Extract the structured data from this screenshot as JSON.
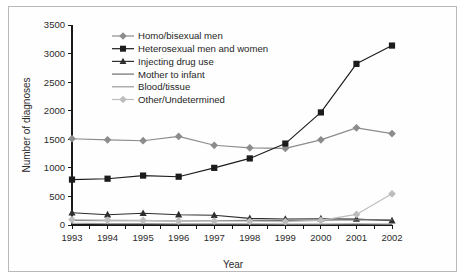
{
  "chart_data": {
    "type": "line",
    "title": "",
    "xlabel": "Year",
    "ylabel": "Number of diagnoses",
    "categories": [
      "1993",
      "1994",
      "1995",
      "1996",
      "1997",
      "1998",
      "1999",
      "2000",
      "2001",
      "2002"
    ],
    "x": [
      1993,
      1994,
      1995,
      1996,
      1997,
      1998,
      1999,
      2000,
      2001,
      2002
    ],
    "ylim": [
      0,
      3500
    ],
    "yticks": [
      0,
      500,
      1000,
      1500,
      2000,
      2500,
      3000,
      3500
    ],
    "ytick_labels": [
      "0",
      "500",
      "1000",
      "1500",
      "2000",
      "2500",
      "3000",
      "3500"
    ],
    "grid": false,
    "legend_position": "top-left-inside",
    "series": [
      {
        "name": "Homo/bisexual men",
        "color": "#8c8c8c",
        "marker": "diamond",
        "values": [
          1510,
          1490,
          1475,
          1550,
          1395,
          1350,
          1340,
          1490,
          1700,
          1600
        ]
      },
      {
        "name": "Heterosexual men and women",
        "color": "#1c1c1c",
        "marker": "square",
        "values": [
          795,
          810,
          865,
          845,
          1000,
          1165,
          1425,
          1970,
          2820,
          3140
        ]
      },
      {
        "name": "Injecting drug use",
        "color": "#2e2e2e",
        "marker": "triangle",
        "values": [
          215,
          180,
          205,
          180,
          170,
          115,
          105,
          110,
          105,
          75
        ]
      },
      {
        "name": "Mother to infant",
        "color": "#6f6f6f",
        "marker": "none",
        "values": [
          80,
          75,
          75,
          70,
          75,
          80,
          80,
          85,
          95,
          90
        ]
      },
      {
        "name": "Blood/tissue",
        "color": "#9a9a9a",
        "marker": "none",
        "values": [
          30,
          25,
          25,
          20,
          20,
          20,
          15,
          15,
          20,
          15
        ]
      },
      {
        "name": "Other/Undetermined",
        "color": "#bdbdbd",
        "marker": "diamond",
        "values": [
          95,
          85,
          80,
          70,
          70,
          65,
          60,
          80,
          185,
          545
        ]
      }
    ]
  },
  "axes": {
    "y_axis_title": "Number of diagnoses",
    "x_axis_title": "Year"
  },
  "legend": {
    "items": [
      {
        "label": "Homo/bisexual men",
        "marker": "diamond",
        "color": "#8c8c8c"
      },
      {
        "label": "Heterosexual men and women",
        "marker": "square",
        "color": "#1c1c1c"
      },
      {
        "label": "Injecting drug use",
        "marker": "triangle",
        "color": "#2e2e2e"
      },
      {
        "label": "Mother to infant",
        "marker": "none",
        "color": "#6f6f6f"
      },
      {
        "label": "Blood/tissue",
        "marker": "none",
        "color": "#9a9a9a"
      },
      {
        "label": "Other/Undetermined",
        "marker": "diamond",
        "color": "#bdbdbd"
      }
    ]
  },
  "colors": {
    "frame": "#b9b9b9",
    "axis": "#1a1a1a",
    "background": "#ffffff",
    "text": "#1e1e1e"
  }
}
